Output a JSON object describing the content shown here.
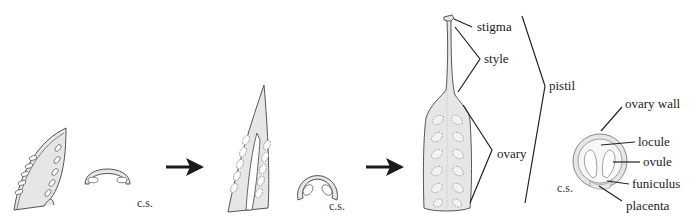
{
  "diagram": {
    "title": "",
    "stages": [
      {
        "id": "stage-1",
        "name": "open carpel leaf",
        "cs_label": "c.s."
      },
      {
        "id": "stage-2",
        "name": "folding carpel",
        "cs_label": "c.s."
      },
      {
        "id": "stage-3",
        "name": "closed pistil",
        "cs_label": "c.s."
      }
    ],
    "arrows": 2,
    "pistil_labels": {
      "stigma": "stigma",
      "style": "style",
      "ovary": "ovary",
      "pistil": "pistil"
    },
    "cross_section_labels": {
      "ovary_wall": "ovary wall",
      "locule": "locule",
      "ovule": "ovule",
      "funiculus": "funiculus",
      "placenta": "placenta"
    },
    "colors": {
      "fill": "#e6e6e6",
      "stroke": "#555555",
      "arrow": "#1a1a1a",
      "label_line": "#222222"
    }
  }
}
